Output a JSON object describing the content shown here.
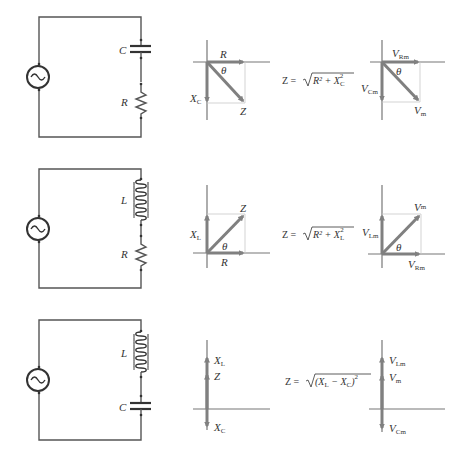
{
  "colors": {
    "wire": "#555555",
    "vector": "#808080",
    "axis": "#777777",
    "guide": "#c8c8c8",
    "text": "#333333"
  },
  "rows": [
    {
      "circuit": {
        "type": "RC",
        "component_top": "C",
        "component_bottom": "R"
      },
      "impedance_diagram": {
        "horizontal": "R",
        "vertical": "X",
        "vertical_sub": "C",
        "resultant": "Z",
        "angle": "θ"
      },
      "formula": {
        "lhs": "Z = ",
        "radicand": "R² + X",
        "sub": "C",
        "sup": "2"
      },
      "voltage_diagram": {
        "horizontal": "V",
        "horizontal_sub": "Rm",
        "vertical": "V",
        "vertical_sub": "Cm",
        "resultant": "V",
        "resultant_sub": "m",
        "angle": "θ"
      }
    },
    {
      "circuit": {
        "type": "RL",
        "component_top": "L",
        "component_bottom": "R"
      },
      "impedance_diagram": {
        "horizontal": "R",
        "vertical": "X",
        "vertical_sub": "L",
        "resultant": "Z",
        "angle": "θ"
      },
      "formula": {
        "lhs": "Z = ",
        "radicand": "R² + X",
        "sub": "L",
        "sup": "2"
      },
      "voltage_diagram": {
        "horizontal": "V",
        "horizontal_sub": "Rm",
        "vertical": "V",
        "vertical_sub": "Lm",
        "resultant": "V",
        "resultant_sub": "m",
        "angle": "θ"
      }
    },
    {
      "circuit": {
        "type": "LC",
        "component_top": "L",
        "component_bottom": "C"
      },
      "impedance_diagram": {
        "up": "X",
        "up_sub": "L",
        "resultant": "Z",
        "down": "X",
        "down_sub": "C"
      },
      "formula": {
        "lhs": "Z = ",
        "radicand_a": "(X",
        "sub_a": "L",
        "minus": " − X",
        "sub_b": "C",
        "close": ")",
        "sup": "2"
      },
      "voltage_diagram": {
        "up": "V",
        "up_sub": "Lm",
        "resultant": "V",
        "resultant_sub": "m",
        "down": "V",
        "down_sub": "Cm"
      }
    }
  ]
}
